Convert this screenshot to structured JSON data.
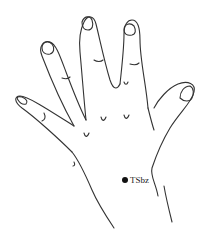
{
  "figure": {
    "stroke_color": "#333333",
    "background": "#ffffff"
  },
  "acupoint": {
    "label": "TSbz",
    "marker_color": "#111111"
  }
}
